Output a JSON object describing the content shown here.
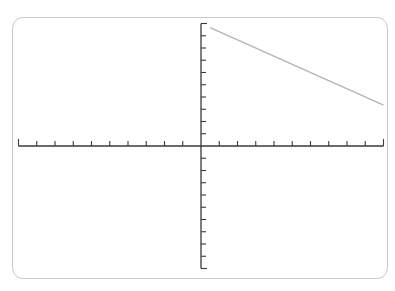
{
  "chart_data": {
    "type": "line",
    "title": "",
    "xlabel": "",
    "ylabel": "",
    "xlim": [
      -10,
      10
    ],
    "ylim": [
      -10,
      10
    ],
    "x_tick_step": 1,
    "y_tick_step": 1,
    "grid": false,
    "legend": null,
    "series": [
      {
        "name": "line",
        "color": "#b5b5b5",
        "x": [
          0.5,
          10
        ],
        "y": [
          9.67,
          3.33
        ]
      }
    ]
  },
  "colors": {
    "axis": "#3a3a3a",
    "frame_border": "#c9c9c9",
    "line": "#b5b5b5",
    "background": "#ffffff"
  }
}
